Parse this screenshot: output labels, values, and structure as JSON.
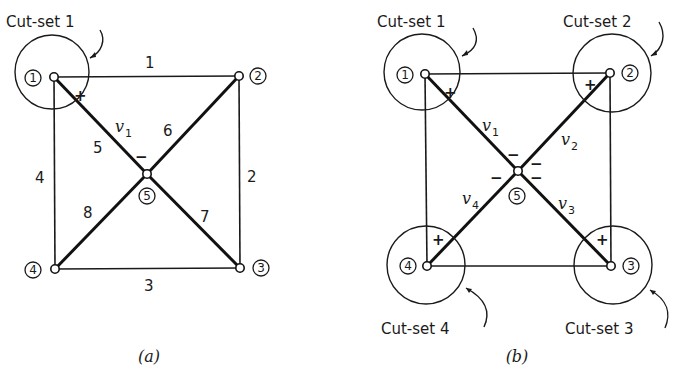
{
  "figure": {
    "panel_a": {
      "caption": "(a)",
      "cutset_label": "Cut-set 1",
      "nodes": [
        {
          "id": "1",
          "label": "1"
        },
        {
          "id": "2",
          "label": "2"
        },
        {
          "id": "3",
          "label": "3"
        },
        {
          "id": "4",
          "label": "4"
        },
        {
          "id": "5",
          "label": "5"
        }
      ],
      "edges": [
        {
          "label": "1",
          "from": "1",
          "to": "2"
        },
        {
          "label": "2",
          "from": "2",
          "to": "3"
        },
        {
          "label": "3",
          "from": "4",
          "to": "3"
        },
        {
          "label": "4",
          "from": "1",
          "to": "4"
        },
        {
          "label": "5",
          "from": "1",
          "to": "5"
        },
        {
          "label": "6",
          "from": "2",
          "to": "5"
        },
        {
          "label": "7",
          "from": "5",
          "to": "3"
        },
        {
          "label": "8",
          "from": "4",
          "to": "5"
        }
      ],
      "voltage": {
        "symbol": "v",
        "sub": "1",
        "plus": "+",
        "minus": "−"
      }
    },
    "panel_b": {
      "caption": "(b)",
      "cutsets": [
        {
          "label": "Cut-set 1"
        },
        {
          "label": "Cut-set 2"
        },
        {
          "label": "Cut-set 3"
        },
        {
          "label": "Cut-set 4"
        }
      ],
      "nodes": [
        {
          "id": "1",
          "label": "1"
        },
        {
          "id": "2",
          "label": "2"
        },
        {
          "id": "3",
          "label": "3"
        },
        {
          "id": "4",
          "label": "4"
        },
        {
          "id": "5",
          "label": "5"
        }
      ],
      "voltages": [
        {
          "symbol": "v",
          "sub": "1"
        },
        {
          "symbol": "v",
          "sub": "2"
        },
        {
          "symbol": "v",
          "sub": "3"
        },
        {
          "symbol": "v",
          "sub": "4"
        }
      ],
      "signs": {
        "plus": "+",
        "minus": "−"
      }
    }
  }
}
